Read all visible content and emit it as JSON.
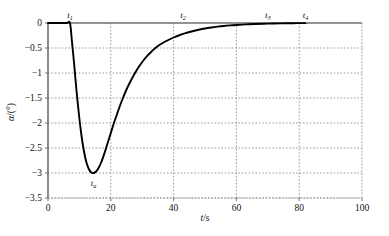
{
  "chart_data": {
    "type": "line",
    "title": "",
    "xlabel": "t/s",
    "ylabel": "α/(°)",
    "xlim": [
      0,
      100
    ],
    "ylim": [
      -3.5,
      0
    ],
    "grid": true,
    "legend": "none",
    "x_ticks": [
      "0",
      "20",
      "40",
      "60",
      "80",
      "100"
    ],
    "x_tick_values": [
      0,
      20,
      40,
      60,
      80,
      100
    ],
    "y_ticks": [
      "0",
      "-0.5",
      "-1",
      "-1.5",
      "-2",
      "-2.5",
      "-3",
      "-3.5"
    ],
    "y_tick_values": [
      0,
      -0.5,
      -1,
      -1.5,
      -2,
      -2.5,
      -3,
      -3.5
    ],
    "series": [
      {
        "name": "alpha",
        "color": "#000000",
        "x": [
          0,
          2,
          4,
          6,
          7,
          7.6,
          8.3,
          9,
          9.8,
          10.6,
          11.4,
          12.2,
          13,
          13.8,
          14.5,
          15.3,
          16.1,
          17,
          18,
          19,
          20,
          21,
          22,
          23,
          24,
          25,
          26,
          27,
          28,
          29,
          30,
          31,
          32,
          33,
          34,
          35,
          36,
          38,
          40,
          42,
          44,
          46,
          48,
          50,
          52,
          54,
          56,
          58,
          60,
          63,
          66,
          70,
          74,
          78,
          82
        ],
        "y": [
          0,
          0,
          0,
          0,
          0,
          -0.35,
          -0.8,
          -1.3,
          -1.8,
          -2.22,
          -2.55,
          -2.78,
          -2.92,
          -2.99,
          -3.0,
          -2.97,
          -2.9,
          -2.78,
          -2.6,
          -2.4,
          -2.2,
          -2.0,
          -1.82,
          -1.64,
          -1.48,
          -1.33,
          -1.2,
          -1.08,
          -0.97,
          -0.87,
          -0.78,
          -0.7,
          -0.63,
          -0.57,
          -0.51,
          -0.46,
          -0.42,
          -0.35,
          -0.29,
          -0.24,
          -0.2,
          -0.165,
          -0.135,
          -0.11,
          -0.09,
          -0.073,
          -0.059,
          -0.048,
          -0.039,
          -0.028,
          -0.02,
          -0.012,
          -0.007,
          -0.004,
          -0.002
        ]
      }
    ],
    "annotations": [
      {
        "name": "t1",
        "label": "t",
        "subscript": "1",
        "x": 7,
        "position": "above-axis",
        "note": "onset time"
      },
      {
        "name": "ta",
        "label": "t",
        "subscript": "a",
        "x": 14.5,
        "position": "below-minimum",
        "note": "time of minimum, alpha = -3"
      },
      {
        "name": "t2",
        "label": "t",
        "subscript": "2",
        "x": 43,
        "position": "above-axis"
      },
      {
        "name": "t3",
        "label": "t",
        "subscript": "3",
        "x": 70,
        "position": "above-axis"
      },
      {
        "name": "t4",
        "label": "t",
        "subscript": "4",
        "x": 82,
        "position": "above-axis"
      }
    ],
    "minimum": {
      "x": 14.5,
      "y": -3.0
    },
    "colors": {
      "curve": "#000000",
      "grid": "#9a9a9a",
      "frame": "#555555",
      "text": "#111111"
    }
  },
  "axis": {
    "x_title_var": "t",
    "x_title_unit": "/s",
    "y_title_var": "α",
    "y_title_unit": "/(°)"
  }
}
